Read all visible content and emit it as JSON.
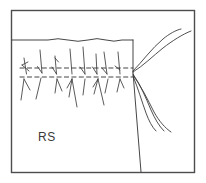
{
  "figure": {
    "kind": "sewing-technique-illustration",
    "caption_label": "RS",
    "caption_meaning": "RS",
    "frame": {
      "border_color": "#4a4a4a",
      "background_color": "#ffffff",
      "width": 206,
      "height": 183
    },
    "ink_color": "#3c3c3c",
    "fabric": {
      "name": "fabric-panel",
      "top_edge_style": "wavy",
      "right_edge_style": "straight-vertical",
      "top_edge_y": 40,
      "right_edge_x": 133
    },
    "stitch_lines": {
      "count": 2,
      "style": "dashed",
      "upper_y": 68,
      "lower_y": 77,
      "start_x": 20,
      "end_x": 133
    },
    "stitch_marks": {
      "count": 14,
      "description": "diagonal overlock stitch legs crossing the dashed lines"
    },
    "threads": {
      "upper_count": 2,
      "lower_count": 3,
      "convergence_x": 133,
      "convergence_y": 72
    }
  }
}
